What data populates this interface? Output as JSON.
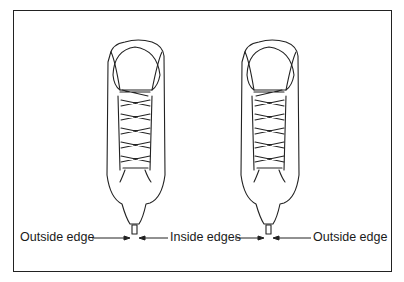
{
  "figure": {
    "title_fragment": "",
    "labels": {
      "left": "Outside edge",
      "middle": "Inside edges",
      "right": "Outside edge"
    },
    "colors": {
      "line": "#222222",
      "background": "#ffffff"
    }
  }
}
